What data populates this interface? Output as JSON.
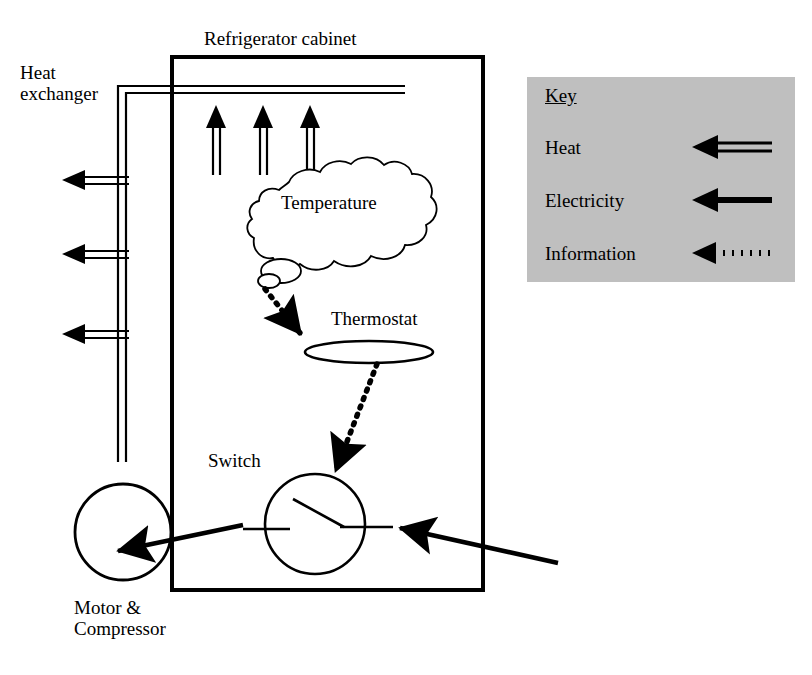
{
  "diagram": {
    "labels": {
      "refrigerator_cabinet": "Refrigerator cabinet",
      "heat_exchanger": "Heat\nexchanger",
      "temperature": "Temperature",
      "thermostat": "Thermostat",
      "switch": "Switch",
      "motor_compressor": "Motor &\nCompressor"
    },
    "colors": {
      "line": "#000000",
      "background": "#ffffff",
      "key_background": "#bfbfbf"
    }
  },
  "key": {
    "title": "Key",
    "rows": [
      {
        "label": "Heat",
        "arrow_style": "double-line-arrow"
      },
      {
        "label": "Electricity",
        "arrow_style": "solid-thick-arrow"
      },
      {
        "label": "Information",
        "arrow_style": "dotted-arrow"
      }
    ]
  },
  "elements": {
    "cabinet": {
      "name": "Refrigerator cabinet",
      "shape": "rectangle"
    },
    "heat_exchanger": {
      "name": "Heat exchanger",
      "shape": "double-line-L"
    },
    "thought_cloud": {
      "name": "Temperature",
      "shape": "cloud"
    },
    "thermostat": {
      "name": "Thermostat",
      "shape": "ellipse"
    },
    "switch": {
      "name": "Switch",
      "shape": "circle-with-open-contact"
    },
    "motor": {
      "name": "Motor & Compressor",
      "shape": "circle"
    }
  },
  "flows": [
    {
      "from": "Refrigerator cabinet interior",
      "to": "Heat exchanger",
      "type": "Heat",
      "direction": "up"
    },
    {
      "from": "Heat exchanger",
      "to": "Ambient",
      "type": "Heat",
      "direction": "left",
      "count": 3
    },
    {
      "from": "Temperature",
      "to": "Thermostat",
      "type": "Information"
    },
    {
      "from": "Thermostat",
      "to": "Switch",
      "type": "Information"
    },
    {
      "from": "Mains supply",
      "to": "Switch",
      "type": "Electricity"
    },
    {
      "from": "Switch",
      "to": "Motor & Compressor",
      "type": "Electricity"
    }
  ]
}
